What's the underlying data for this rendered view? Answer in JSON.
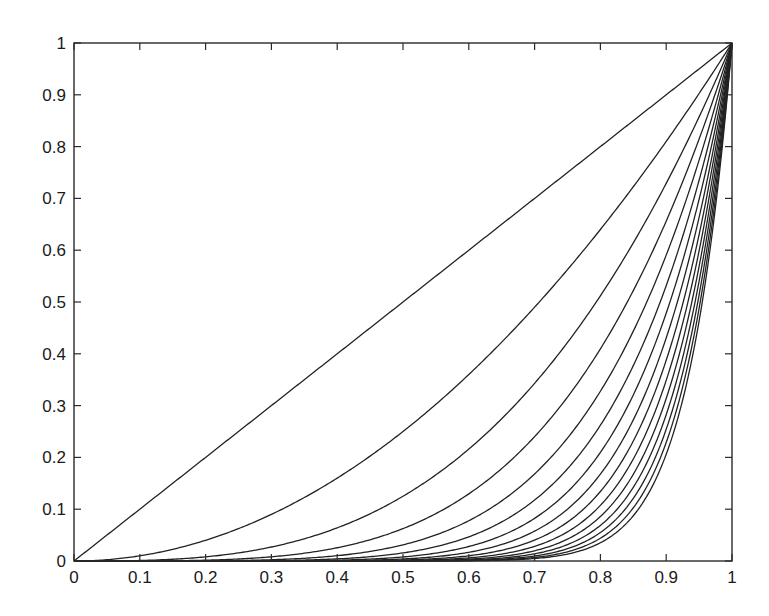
{
  "chart_data": {
    "type": "line",
    "title": "",
    "xlabel": "",
    "ylabel": "",
    "xlim": [
      0,
      1
    ],
    "ylim": [
      0,
      1
    ],
    "grid": false,
    "legend": null,
    "x_ticks": [
      "0",
      "0.1",
      "0.2",
      "0.3",
      "0.4",
      "0.5",
      "0.6",
      "0.7",
      "0.8",
      "0.9",
      "1"
    ],
    "y_ticks": [
      "0",
      "0.1",
      "0.2",
      "0.3",
      "0.4",
      "0.5",
      "0.6",
      "0.7",
      "0.8",
      "0.9",
      "1"
    ],
    "series": [
      {
        "name": "x^1",
        "exponent": 1
      },
      {
        "name": "x^2",
        "exponent": 2
      },
      {
        "name": "x^3",
        "exponent": 3
      },
      {
        "name": "x^4",
        "exponent": 4
      },
      {
        "name": "x^5",
        "exponent": 5
      },
      {
        "name": "x^6",
        "exponent": 6
      },
      {
        "name": "x^7",
        "exponent": 7
      },
      {
        "name": "x^8",
        "exponent": 8
      },
      {
        "name": "x^9",
        "exponent": 9
      },
      {
        "name": "x^10",
        "exponent": 10
      },
      {
        "name": "x^11",
        "exponent": 11
      },
      {
        "name": "x^12",
        "exponent": 12
      },
      {
        "name": "x^13",
        "exponent": 13
      },
      {
        "name": "x^14",
        "exponent": 14
      },
      {
        "name": "x^15",
        "exponent": 15
      }
    ],
    "sample_values_at_x_0_8": {
      "x^1": 0.8,
      "x^2": 0.64,
      "x^3": 0.512,
      "x^4": 0.41,
      "x^5": 0.328,
      "x^6": 0.262,
      "x^7": 0.21,
      "x^8": 0.168,
      "x^9": 0.134,
      "x^10": 0.107
    },
    "line_color": "#222222"
  },
  "plot_area": {
    "left": 74,
    "top": 43,
    "right": 732,
    "bottom": 561
  }
}
